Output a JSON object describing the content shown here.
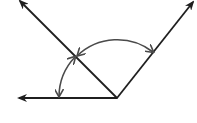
{
  "diagram": {
    "type": "angle-diagram",
    "colors": {
      "ray": "#1f1f1f",
      "arc": "#4a4a4a",
      "background": "#ffffff"
    },
    "vertex": {
      "x": 117,
      "y": 98
    },
    "rays": [
      {
        "id": "left",
        "to": {
          "x": 18,
          "y": 98
        }
      },
      {
        "id": "upper-left",
        "to": {
          "x": 20,
          "y": 1
        }
      },
      {
        "id": "upper-right",
        "to": {
          "x": 193,
          "y": 2
        }
      }
    ],
    "arcs": [
      {
        "id": "angle-small",
        "from_ray": "left",
        "to_ray": "upper-left",
        "radius": 58
      },
      {
        "id": "angle-large",
        "from_ray": "upper-left",
        "to_ray": "upper-right",
        "radius": 58
      }
    ],
    "labels": []
  }
}
